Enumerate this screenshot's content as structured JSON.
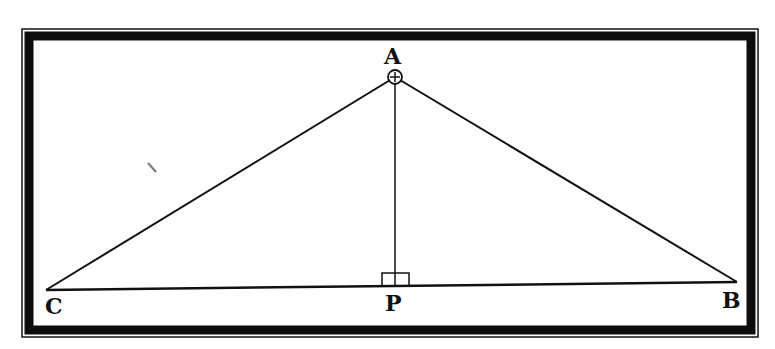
{
  "diagram": {
    "type": "geometry-triangle-with-altitude",
    "colors": {
      "background": "#ffffff",
      "ink": "#111111",
      "frame": "#0d0d0d"
    },
    "points": {
      "A": {
        "label": "A",
        "x": 395,
        "y": 77
      },
      "B": {
        "label": "B",
        "x": 737,
        "y": 282
      },
      "C": {
        "label": "C",
        "x": 46,
        "y": 290
      },
      "P": {
        "label": "P",
        "x": 395,
        "y": 286
      }
    },
    "segments": [
      {
        "from": "A",
        "to": "C"
      },
      {
        "from": "A",
        "to": "B"
      },
      {
        "from": "C",
        "to": "B"
      },
      {
        "from": "A",
        "to": "P"
      }
    ],
    "markers": {
      "right_angle_at": "P",
      "circle_plus_at": "A"
    }
  }
}
